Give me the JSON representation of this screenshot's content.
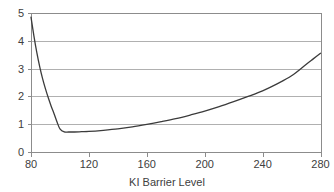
{
  "chart_data": {
    "type": "line",
    "title": "",
    "subtitle": "",
    "xlabel": "KI Barrier Level",
    "ylabel": "",
    "xlim": [
      80,
      280
    ],
    "ylim": [
      0,
      5
    ],
    "xticks": [
      80,
      120,
      160,
      200,
      240,
      280
    ],
    "yticks": [
      0,
      1,
      2,
      3,
      4,
      5
    ],
    "xtick_labels": [
      "80",
      "120",
      "160",
      "200",
      "240",
      "280"
    ],
    "ytick_labels": [
      "0",
      "1",
      "2",
      "3",
      "4",
      "5"
    ],
    "grid": "horizontal",
    "legend": "none",
    "series": [
      {
        "name": "value",
        "color": "#3b3b3b",
        "x": [
          80,
          82,
          84,
          86,
          88,
          90,
          92,
          94,
          96,
          98,
          100,
          103,
          106,
          110,
          115,
          120,
          130,
          140,
          150,
          160,
          170,
          180,
          190,
          200,
          210,
          220,
          230,
          240,
          250,
          260,
          270,
          275,
          280
        ],
        "values": [
          4.85,
          4.18,
          3.58,
          3.07,
          2.64,
          2.27,
          1.94,
          1.64,
          1.37,
          1.08,
          0.83,
          0.72,
          0.72,
          0.72,
          0.73,
          0.74,
          0.78,
          0.83,
          0.9,
          0.99,
          1.09,
          1.2,
          1.33,
          1.47,
          1.63,
          1.81,
          2.0,
          2.2,
          2.45,
          2.74,
          3.15,
          3.35,
          3.55
        ]
      }
    ],
    "annotations": []
  },
  "axis": {
    "x_title": "KI Barrier Level"
  },
  "style": {
    "line_color": "#3b3b3b",
    "grid_color": "#b0b0b0",
    "axis_color": "#8c8c8c",
    "text_color": "#404040",
    "background": "#ffffff"
  }
}
